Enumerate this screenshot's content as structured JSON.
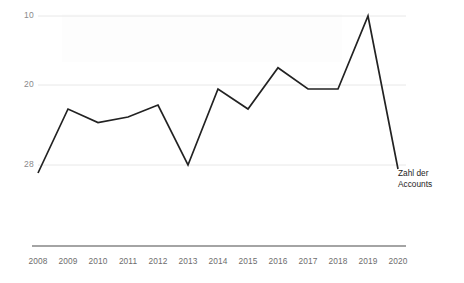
{
  "chart_data": {
    "type": "line",
    "title": "",
    "xlabel": "",
    "ylabel": "",
    "categories": [
      "2008",
      "2009",
      "2010",
      "2011",
      "2012",
      "2013",
      "2014",
      "2015",
      "2016",
      "2017",
      "2018",
      "2019",
      "2020"
    ],
    "series": [
      {
        "name": "Zahl der Accounts",
        "values": [
          9,
          17,
          15.3,
          16,
          17.5,
          10,
          19.5,
          17,
          22,
          19.5,
          19.5,
          28,
          9.5
        ],
        "color": "#222222"
      }
    ],
    "ylim": [
      0,
      28
    ],
    "yticks": [
      10,
      20,
      28
    ],
    "ytick_labels": [
      "10",
      "20",
      "28"
    ],
    "grid": true,
    "grid_color": "#e8e8e8",
    "legend_position": "line-end-right",
    "axis_color": "#4a4a4a"
  },
  "legend": {
    "series_label_line1": "Zahl der",
    "series_label_line2": "Accounts"
  }
}
